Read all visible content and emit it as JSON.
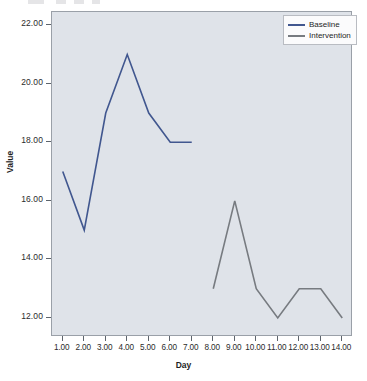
{
  "chart_data": {
    "type": "line",
    "title": "",
    "xlabel": "Day",
    "ylabel": "Value",
    "xlim": [
      0.5,
      14.5
    ],
    "ylim": [
      11.35,
      22.45
    ],
    "grid": false,
    "legend_position": "top-right",
    "x_ticks": [
      "1.00",
      "2.00",
      "3.00",
      "4.00",
      "5.00",
      "6.00",
      "7.00",
      "8.00",
      "9.00",
      "10.00",
      "11.00",
      "12.00",
      "13.00",
      "14.00"
    ],
    "x_tick_values": [
      1,
      2,
      3,
      4,
      5,
      6,
      7,
      8,
      9,
      10,
      11,
      12,
      13,
      14
    ],
    "y_ticks": [
      "12.00",
      "14.00",
      "16.00",
      "18.00",
      "20.00",
      "22.00"
    ],
    "y_tick_values": [
      12,
      14,
      16,
      18,
      20,
      22
    ],
    "series": [
      {
        "name": "Baseline",
        "color": "#41578f",
        "x": [
          1,
          2,
          3,
          4,
          5,
          6,
          7
        ],
        "values": [
          17,
          15,
          19,
          21,
          19,
          18,
          18
        ]
      },
      {
        "name": "Intervention",
        "color": "#777b80",
        "x": [
          8,
          9,
          10,
          11,
          12,
          13,
          14
        ],
        "values": [
          13,
          16,
          13,
          12,
          13,
          13,
          12
        ]
      }
    ]
  },
  "legend": {
    "items": [
      {
        "label": "Baseline",
        "color": "#41578f"
      },
      {
        "label": "Intervention",
        "color": "#777b80"
      }
    ]
  },
  "axes": {
    "x_title": "Day",
    "y_title": "Value"
  },
  "colors": {
    "plot_background": "#dfe3e9",
    "page_background": "#ffffff",
    "axis": "#5d646c",
    "baseline": "#41578f",
    "intervention": "#777b80"
  }
}
